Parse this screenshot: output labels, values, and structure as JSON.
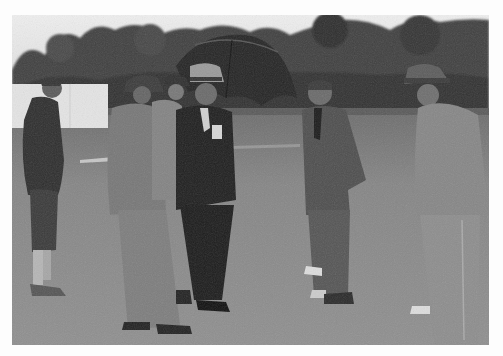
{
  "image": {
    "type": "photograph",
    "style": "black-and-white vintage",
    "description": "Six men in suits and hats stand on a grass field inspecting the ground; one holds an open umbrella; trees and a white sightscreen in the background",
    "border_color": "#fdfdfd",
    "tones": {
      "sky": "#e9e9e9",
      "trees": "#3e3e3e",
      "ground": "#8a8a8a",
      "ground_far": "#6f6f6f",
      "suit_dark": "#2a2a2a",
      "suit_mid": "#6c6c6c",
      "suit_light": "#8f8f8f",
      "screen": "#e4e4e4"
    },
    "subjects": [
      {
        "id": "man-left",
        "position": "far left",
        "attire": "dark jacket, plus-fours, light socks, bareheaded"
      },
      {
        "id": "man-back-hat",
        "position": "left-center",
        "attire": "light grey suit, dark hat, back to viewer"
      },
      {
        "id": "man-background-hat",
        "position": "center, partly hidden",
        "attire": "dark hat, light jacket"
      },
      {
        "id": "man-umbrella",
        "position": "center",
        "attire": "dark suit, light fedora, holding umbrella"
      },
      {
        "id": "man-center-right",
        "position": "center right",
        "attire": "grey suit, tie, hands in pocket, bareheaded"
      },
      {
        "id": "man-right",
        "position": "far right",
        "attire": "light suit, fedora, looking down"
      }
    ],
    "props": [
      "open black umbrella",
      "white sightscreen"
    ]
  }
}
